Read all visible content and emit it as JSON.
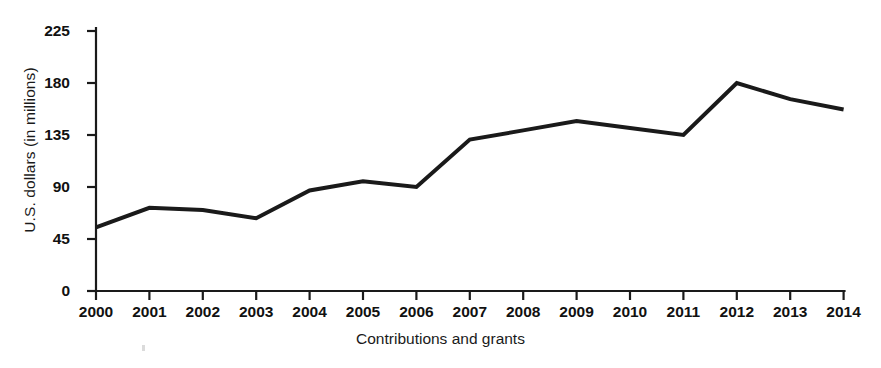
{
  "chart_data": {
    "type": "line",
    "title": "",
    "xlabel": "Contributions and grants",
    "ylabel": "U.S. dollars (in millions)",
    "categories": [
      "2000",
      "2001",
      "2002",
      "2003",
      "2004",
      "2005",
      "2006",
      "2007",
      "2008",
      "2009",
      "2010",
      "2011",
      "2012",
      "2013",
      "2014"
    ],
    "values": [
      55,
      72,
      70,
      63,
      87,
      95,
      90,
      131,
      139,
      147,
      141,
      135,
      180,
      166,
      157
    ],
    "series": [
      {
        "name": "Contributions and grants",
        "values": [
          55,
          72,
          70,
          63,
          87,
          95,
          90,
          131,
          139,
          147,
          141,
          135,
          180,
          166,
          157
        ]
      }
    ],
    "yticks": [
      0,
      45,
      90,
      135,
      180,
      225
    ],
    "ytick_labels": [
      "0",
      "45",
      "90",
      "135",
      "180",
      "225"
    ],
    "xtick_labels": [
      "2000",
      "2001",
      "2002",
      "2003",
      "2004",
      "2005",
      "2006",
      "2007",
      "2008",
      "2009",
      "2010",
      "2011",
      "2012",
      "2013",
      "2014"
    ],
    "ylim": [
      0,
      225
    ],
    "xlim": [
      "2000",
      "2014"
    ],
    "grid": false,
    "legend": false,
    "legend_position": "none",
    "line_color": "#1a1a1a",
    "line_width": 4,
    "background_color": "#ffffff",
    "axis_color": "#1a1a1a"
  }
}
